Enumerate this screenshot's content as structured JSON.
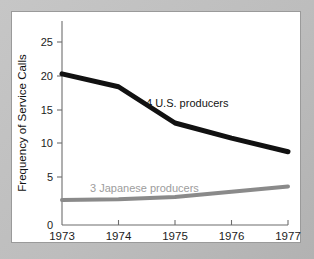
{
  "chart_data": {
    "type": "line",
    "title": "",
    "xlabel": "",
    "ylabel": "Frequency of Service Calls",
    "x": [
      1973,
      1974,
      1975,
      1976,
      1977
    ],
    "xtick_labels": [
      "1973",
      "1974",
      "1975",
      "1976",
      "1977"
    ],
    "ytick_labels": [
      "0",
      "5",
      "10",
      "15",
      "20",
      "25"
    ],
    "ytick_values": [
      0,
      5,
      10,
      15,
      20,
      25
    ],
    "xlim": [
      1973,
      1977
    ],
    "ylim": [
      0,
      27
    ],
    "grid": false,
    "legend_position": "inline-annotation",
    "series": [
      {
        "name": "4 U.S. producers",
        "label": "4 U.S. producers",
        "color": "#111111",
        "width": 5,
        "values": [
          20.0,
          18.3,
          13.5,
          11.5,
          9.7
        ]
      },
      {
        "name": "3 Japanese producers",
        "label": "3 Japanese producers",
        "color": "#8a8a8a",
        "width": 4,
        "values": [
          3.3,
          3.4,
          3.7,
          4.4,
          5.1
        ]
      }
    ],
    "annotations": [
      {
        "text": "4 U.S. producers",
        "series": "4 U.S. producers"
      },
      {
        "text": "3 Japanese producers",
        "series": "3 Japanese producers"
      }
    ]
  },
  "axes": {
    "y_title": "Frequency of Service Calls",
    "y_ticks": [
      "25",
      "20",
      "15",
      "10",
      "5",
      "0"
    ],
    "x_ticks": [
      "1973",
      "1974",
      "1975",
      "1976",
      "1977"
    ]
  },
  "labels": {
    "us_producers": "4 U.S. producers",
    "japanese_producers": "3 Japanese producers"
  },
  "colors": {
    "us_line": "#111111",
    "japanese_line": "#8a8a8a",
    "panel_background": "#ffffff",
    "page_background": "#bdbdbd",
    "axis": "#6d6d6d",
    "text": "#1c1c1c"
  }
}
